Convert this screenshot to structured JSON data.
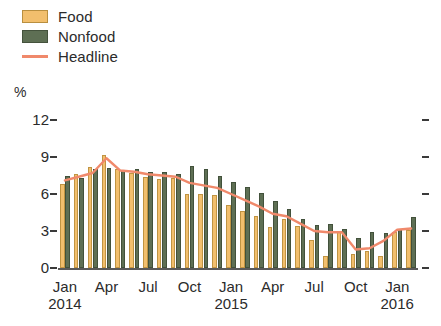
{
  "legend": {
    "items": [
      {
        "key": "food",
        "label": "Food",
        "color": "#f2bf6d",
        "type": "swatch"
      },
      {
        "key": "nonfood",
        "label": "Nonfood",
        "color": "#5e6f54",
        "type": "swatch"
      },
      {
        "key": "headline",
        "label": "Headline",
        "color": "#f0896b",
        "type": "line"
      }
    ]
  },
  "axis": {
    "unit_label": "%",
    "y_ticks": [
      "12",
      "9",
      "6",
      "3",
      "0"
    ],
    "x_labels": [
      {
        "month": "Jan",
        "year": "2014"
      },
      {
        "month": "Apr",
        "year": ""
      },
      {
        "month": "Jul",
        "year": ""
      },
      {
        "month": "Oct",
        "year": ""
      },
      {
        "month": "Jan",
        "year": "2015"
      },
      {
        "month": "Apr",
        "year": ""
      },
      {
        "month": "Jul",
        "year": ""
      },
      {
        "month": "Oct",
        "year": ""
      },
      {
        "month": "Jan",
        "year": "2016"
      }
    ]
  },
  "chart_data": {
    "type": "bar",
    "title": "",
    "subtitle": "",
    "xlabel": "",
    "ylabel": "%",
    "ylim": [
      0,
      12
    ],
    "yticks": [
      0,
      3,
      6,
      9,
      12
    ],
    "grid": false,
    "legend_position": "top-left",
    "categories": [
      "Jan 2014",
      "Feb 2014",
      "Mar 2014",
      "Apr 2014",
      "May 2014",
      "Jun 2014",
      "Jul 2014",
      "Aug 2014",
      "Sep 2014",
      "Oct 2014",
      "Nov 2014",
      "Dec 2014",
      "Jan 2015",
      "Feb 2015",
      "Mar 2015",
      "Apr 2015",
      "May 2015",
      "Jun 2015",
      "Jul 2015",
      "Aug 2015",
      "Sep 2015",
      "Oct 2015",
      "Nov 2015",
      "Dec 2015",
      "Jan 2016",
      "Feb 2016"
    ],
    "series": [
      {
        "name": "Food",
        "color": "#f2bf6d",
        "type": "bar",
        "values": [
          6.8,
          7.6,
          8.2,
          9.2,
          8.0,
          7.7,
          7.4,
          7.2,
          7.3,
          6.0,
          6.0,
          5.9,
          5.1,
          4.6,
          4.2,
          3.3,
          4.0,
          3.4,
          2.3,
          1.0,
          2.9,
          1.1,
          1.4,
          1.0,
          2.9,
          3.1
        ]
      },
      {
        "name": "Nonfood",
        "color": "#5e6f54",
        "type": "bar",
        "values": [
          7.5,
          7.3,
          8.0,
          8.1,
          7.9,
          8.0,
          7.8,
          7.8,
          7.6,
          8.3,
          8.0,
          7.5,
          7.0,
          6.6,
          6.1,
          5.4,
          4.8,
          4.0,
          3.5,
          3.6,
          3.2,
          2.4,
          2.9,
          2.8,
          3.2,
          4.1
        ]
      },
      {
        "name": "Headline",
        "color": "#f0896b",
        "type": "line",
        "values": [
          7.1,
          7.4,
          7.7,
          8.9,
          7.9,
          7.8,
          7.6,
          7.5,
          7.4,
          6.9,
          6.7,
          6.5,
          6.0,
          5.5,
          5.0,
          4.4,
          4.2,
          3.6,
          3.0,
          2.9,
          2.9,
          1.5,
          1.6,
          2.2,
          3.1,
          3.2
        ]
      }
    ]
  }
}
